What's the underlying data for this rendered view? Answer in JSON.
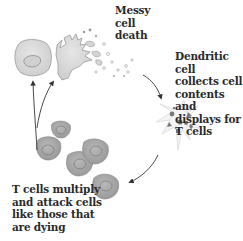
{
  "diagram": {
    "type": "cycle",
    "labels": {
      "messy_death": "Messy\ncell\ndeath",
      "dendritic": "Dendritic cell\ncollects cell\ncontents and\ndisplays for\nT cells",
      "tcells": "T cells multiply\nand attack cells\nlike those that\nare dying"
    },
    "stages": [
      {
        "id": "healthy-cell",
        "description": "Normal cell with nucleus"
      },
      {
        "id": "dying-cell",
        "description": "Cell bursting, scattering contents"
      },
      {
        "id": "dendritic-cell",
        "description": "Dendritic cell with collected fragments"
      },
      {
        "id": "t-cells",
        "description": "Cluster of multiplying T cells"
      }
    ],
    "colors": {
      "cell_fill": "#d4d4d4",
      "cell_stroke": "#8a8a8a",
      "tcell_fill": "#a8a8a8",
      "tcell_nucleus": "#8c8c8c",
      "fragment": "#7a7a7a",
      "arrow": "#333333",
      "text": "#2a2a2a"
    }
  }
}
